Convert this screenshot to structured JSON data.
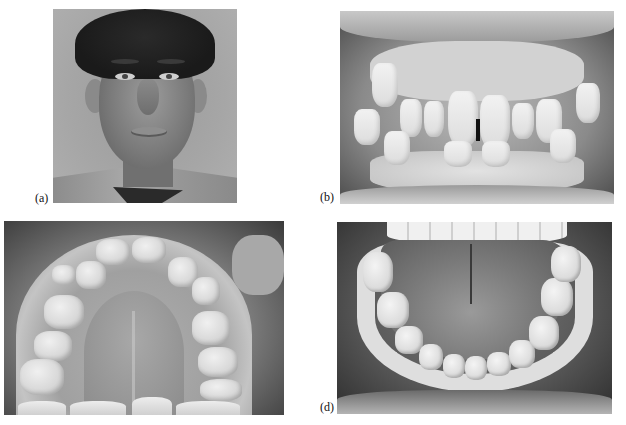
{
  "figure": {
    "panels": [
      {
        "id": "a",
        "label": "(a)",
        "description": "Black-and-white frontal portrait photograph of a young man with dark wavy hair, collared shirt and tie"
      },
      {
        "id": "b",
        "label": "(b)",
        "description": "Intraoral frontal view of teeth in occlusion showing crowding and a midline diastema"
      },
      {
        "id": "c",
        "label": "",
        "description": "Occlusal view of the maxillary (upper) dental arch and palate"
      },
      {
        "id": "d",
        "label": "(d)",
        "description": "Occlusal view of the mandibular (lower) dental arch with tongue"
      }
    ]
  }
}
